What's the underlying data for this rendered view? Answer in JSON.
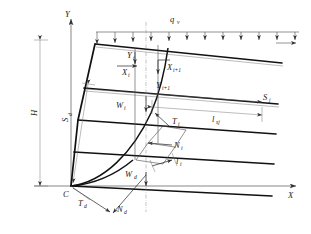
{
  "figure": {
    "type": "engineering-diagram",
    "background_color": "#ffffff",
    "line_color": "#111111",
    "thin_line_color": "#6a6a6a"
  },
  "axes": {
    "y_label": "Y",
    "x_label": "X",
    "origin_label": "C"
  },
  "loads": {
    "distributed_load_label": "q",
    "distributed_load_sub": "v",
    "arrow_count": 12
  },
  "dimensions": {
    "height_label": "H",
    "slope_face_label": "S",
    "slope_face_sub": "d",
    "reinforcement_length_label": "l",
    "reinforcement_length_sub": "sj",
    "reinforcement_force_label": "S",
    "reinforcement_force_sub": "j"
  },
  "slice_forces": {
    "weight_label": "W",
    "weight_sub": "i",
    "tangential_label": "T",
    "tangential_sub": "i",
    "normal_label": "N",
    "normal_sub": "i",
    "base_length_label": "l",
    "base_length_sub": "i",
    "interslice_x_left": "X",
    "interslice_x_left_sub": "i",
    "interslice_y_left": "Y",
    "interslice_y_left_sub": "i",
    "interslice_x_right": "X",
    "interslice_x_right_sub": "i+1",
    "interslice_y_right": "Y",
    "interslice_y_right_sub": "i+1"
  },
  "toe_forces": {
    "weight_label": "W",
    "weight_sub": "d",
    "tangential_label": "T",
    "tangential_sub": "d",
    "normal_label": "N",
    "normal_sub": "d"
  }
}
